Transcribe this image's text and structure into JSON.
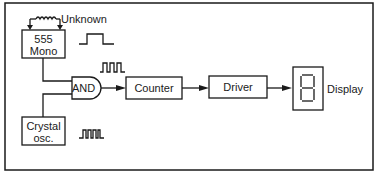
{
  "diagram": {
    "blocks": {
      "mono": {
        "line1": "555",
        "line2": "Mono"
      },
      "crystal": {
        "line1": "Crystal",
        "line2": "osc."
      },
      "and_gate": "AND",
      "counter": "Counter",
      "driver": "Driver",
      "display_label": "Display",
      "display_digit": "8"
    },
    "annotations": {
      "unknown": "Unknown"
    },
    "colors": {
      "stroke": "#1a1a1a",
      "background": "#ffffff"
    }
  }
}
